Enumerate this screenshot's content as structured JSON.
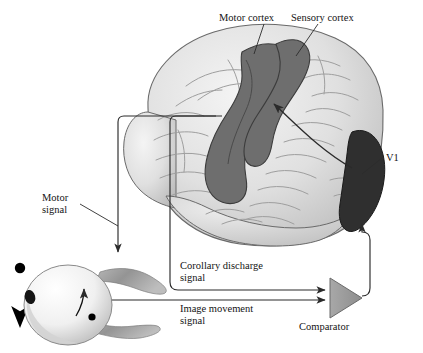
{
  "figure": {
    "type": "anatomical-schematic",
    "background_color": "#ffffff"
  },
  "labels": {
    "motor_cortex": "Motor cortex",
    "sensory_cortex": "Sensory cortex",
    "v1": "V1",
    "motor_signal_line1": "Motor",
    "motor_signal_line2": "signal",
    "corollary_line1": "Corollary discharge",
    "corollary_line2": "signal",
    "image_movement_line1": "Image movement",
    "image_movement_line2": "signal",
    "comparator": "Comparator"
  },
  "colors": {
    "brain_fill": "#e3e3e3",
    "brain_shadow": "#b9b9b9",
    "cortex_strip": "#6e6e6e",
    "v1_region": "#2f2f2f",
    "comparator_fill": "#9a9a9a",
    "line_stroke": "#2b2b2b",
    "muscle_fill": "#9b9b9b",
    "eye_fill": "#f2f2f2",
    "stimulus_dot": "#000000"
  },
  "elements": {
    "brain": "lateral view of human cerebral hemisphere with gyri and sulci",
    "motor_sensory_strip": "dark gray band spanning precentral and postcentral gyri",
    "v1_patch": "near-black occipital pole region",
    "eye": "left-facing eyeball with pupil, extraocular muscles and retinal image dot",
    "stimulus": "black dot with downward arrow indicating moving target",
    "comparator_symbol": "gray right-pointing triangle",
    "arrow_v1_to_sensory": "curved arrow from V1 to sensory cortex",
    "arrow_motor_to_eye": "orthogonal line from motor cortex down to eye muscle",
    "arrow_corollary_to_comparator": "orthogonal line from motor cortex to comparator input",
    "arrow_image_to_comparator": "straight arrow from eye to comparator input",
    "arrow_comparator_to_v1": "line from comparator apex up to V1"
  }
}
